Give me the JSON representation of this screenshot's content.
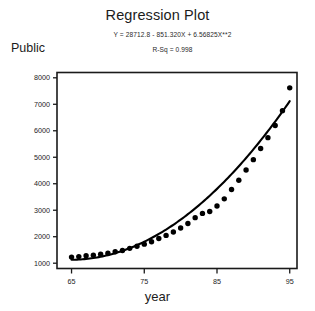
{
  "chart_data": {
    "type": "scatter",
    "title": "Regression Plot",
    "equation": "Y = 28712.8 - 851.320X + 6.56825X**2",
    "rsq_label": "R-Sq = 0.998",
    "rsq_value": 0.998,
    "xlabel": "year",
    "ylabel": "Public",
    "xlim": [
      63,
      96
    ],
    "ylim": [
      800,
      8200
    ],
    "grid": false,
    "legend": null,
    "xticks": [
      65,
      75,
      85,
      95
    ],
    "yticks": [
      1000,
      2000,
      3000,
      4000,
      5000,
      6000,
      7000,
      8000
    ],
    "xtick_labels": [
      "65",
      "75",
      "85",
      "95"
    ],
    "ytick_labels": [
      "1000",
      "2000",
      "3000",
      "4000",
      "5000",
      "6000",
      "7000",
      "8000"
    ],
    "series": [
      {
        "name": "observed",
        "marker": "filled-circle",
        "color": "#000000",
        "x": [
          65,
          66,
          67,
          68,
          69,
          70,
          71,
          72,
          73,
          74,
          75,
          76,
          77,
          78,
          79,
          80,
          81,
          82,
          83,
          84,
          85,
          86,
          87,
          88,
          89,
          90,
          91,
          92,
          93,
          94,
          95
        ],
        "y": [
          1230,
          1250,
          1280,
          1300,
          1340,
          1380,
          1430,
          1480,
          1560,
          1640,
          1720,
          1810,
          1930,
          2050,
          2180,
          2330,
          2500,
          2720,
          2880,
          2950,
          3160,
          3430,
          3780,
          4130,
          4520,
          4910,
          5330,
          5740,
          6200,
          6760,
          7620
        ]
      },
      {
        "name": "quadratic-fit",
        "type": "line",
        "color": "#000000",
        "model": "Y = 28712.8 - 851.320X + 6.56825X**2"
      }
    ]
  },
  "axes": {
    "frame_color": "#1a1a1a"
  }
}
